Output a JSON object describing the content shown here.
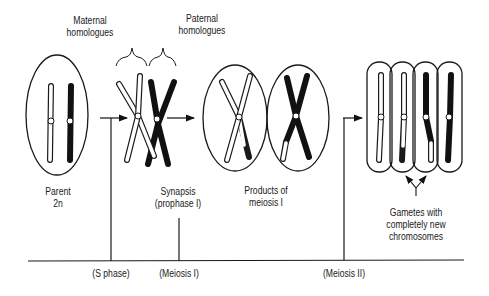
{
  "labels": {
    "maternal": [
      "Maternal",
      "homologues"
    ],
    "paternal": [
      "Paternal",
      "homologues"
    ],
    "parent": [
      "Parent",
      "2n"
    ],
    "synapsis": [
      "Synapsis",
      "(prophase I)"
    ],
    "products": [
      "Products of",
      "meiosis I"
    ],
    "gametes": [
      "Gametes with",
      "completely new",
      "chromosomes"
    ]
  },
  "timeline": {
    "s_phase": "(S phase)",
    "meiosis_1": "(Meiosis I)",
    "meiosis_2": "(Meiosis II)"
  },
  "colors": {
    "maternal": "#ffffff",
    "paternal": "#111111",
    "outline": "#1a1a1a"
  },
  "stages": [
    "parent-cell",
    "synapsis",
    "meiosis-I-products",
    "gametes"
  ]
}
